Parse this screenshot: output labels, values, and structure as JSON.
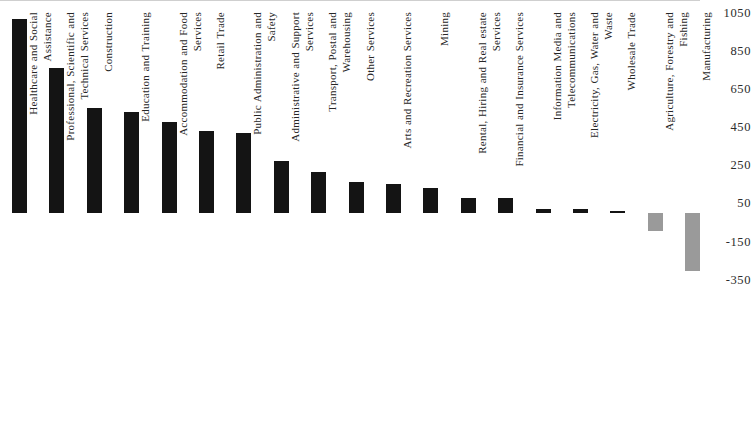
{
  "chart": {
    "title": "",
    "subtitle": ""
  },
  "chart_data": {
    "type": "bar",
    "title": "",
    "xlabel": "",
    "ylabel": "",
    "ylim": [
      -350,
      1050
    ],
    "grid": false,
    "legend": null,
    "orientation": "vertical",
    "baseline_value": 0,
    "y_ticks": [
      1050,
      850,
      650,
      450,
      250,
      50,
      -150,
      -350
    ],
    "y_tick_labels": [
      "1050",
      "850",
      "650",
      "450",
      "250",
      "50",
      "-150",
      "-350"
    ],
    "positive_color": "#141414",
    "negative_color": "#9a9a9a",
    "categories": [
      "Healthcare and Social Assistance",
      "Professional, Scientific and Technical Services",
      "Construction",
      "Education and Training",
      "Accommodation and Food Services",
      "Retail Trade",
      "Public Administration and Safety",
      "Administrative and Support Services",
      "Transport, Postal and Warehousing",
      "Other Services",
      "Arts and Recreation Services",
      "Mining",
      "Rental, Hiring and Real estate Services",
      "Financial and Insurance Services",
      "Information Media and Telecommunications",
      "Electricity, Gas, Water and Waste",
      "Wholesale Trade",
      "Agriculture, Forestry and Fishing",
      "Manufacturing"
    ],
    "category_lines": [
      [
        "Healthcare and Social",
        "Assistance"
      ],
      [
        "Professional, Scientific and",
        "Technical Services"
      ],
      [
        "Construction"
      ],
      [
        "Education and Training"
      ],
      [
        "Accommodation and Food",
        "Services"
      ],
      [
        "Retail Trade"
      ],
      [
        "Public Administration and",
        "Safety"
      ],
      [
        "Administrative and Support",
        "Services"
      ],
      [
        "Transport, Postal and",
        "Warehousing"
      ],
      [
        "Other Services"
      ],
      [
        "Arts and Recreation Services"
      ],
      [
        "Mining"
      ],
      [
        "Rental, Hiring and Real estate",
        "Services"
      ],
      [
        "Financial and Insurance Services"
      ],
      [
        "Information Media and",
        "Telecommunications"
      ],
      [
        "Electricity, Gas, Water and",
        "Waste"
      ],
      [
        "Wholesale Trade"
      ],
      [
        "Agriculture, Forestry and",
        "Fishing"
      ],
      [
        "Manufacturing"
      ]
    ],
    "values": [
      1015,
      760,
      550,
      530,
      475,
      430,
      420,
      275,
      215,
      165,
      150,
      130,
      80,
      80,
      20,
      20,
      5,
      -95,
      -305
    ]
  }
}
